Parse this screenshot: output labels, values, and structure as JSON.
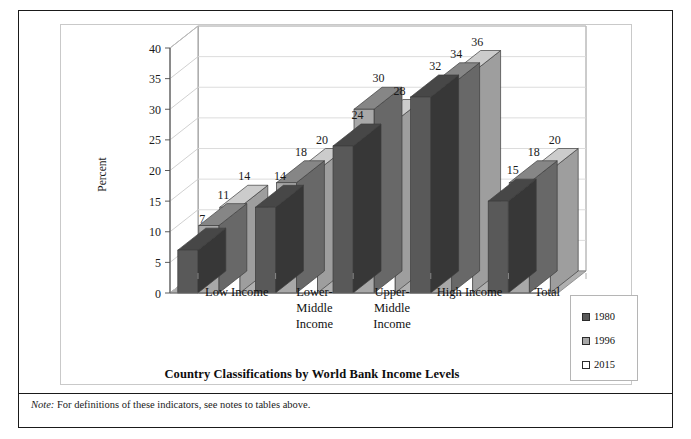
{
  "figure": {
    "title": "Country Classifications by World Bank Income Levels",
    "note_word": "Note:",
    "note_text": " For definitions of these indicators, see notes to tables above."
  },
  "legend": {
    "position": "bottom-right",
    "entries": [
      {
        "label": "1980",
        "color": "#595959"
      },
      {
        "label": "1996",
        "color": "#a8a8a8"
      },
      {
        "label": "2015",
        "color": "#ffffff"
      }
    ]
  },
  "chart_data": {
    "type": "bar",
    "title": "Country Classifications by World Bank Income Levels",
    "xlabel": "",
    "ylabel": "Percent",
    "ylim": [
      0,
      40
    ],
    "yticks": [
      0,
      5,
      10,
      15,
      20,
      25,
      30,
      35,
      40
    ],
    "grid": true,
    "three_d": true,
    "categories": [
      "Low Income",
      "Lower-Middle Income",
      "Upper-Middle Income",
      "High Income",
      "Total"
    ],
    "category_lines": [
      [
        "Low Income"
      ],
      [
        "Lower-",
        "Middle",
        "Income"
      ],
      [
        "Upper-",
        "Middle",
        "Income"
      ],
      [
        "High Income"
      ],
      [
        "Total"
      ]
    ],
    "series": [
      {
        "name": "1980",
        "color": "#595959",
        "values": [
          7,
          14,
          24,
          32,
          15
        ]
      },
      {
        "name": "1996",
        "color": "#a8a8a8",
        "values": [
          11,
          18,
          30,
          34,
          18
        ]
      },
      {
        "name": "2015",
        "color": "#ffffff",
        "values": [
          14,
          20,
          28,
          36,
          20
        ]
      }
    ]
  }
}
